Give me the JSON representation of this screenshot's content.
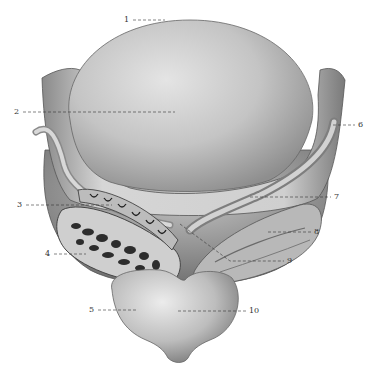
{
  "figure": {
    "background": "#ffffff",
    "ink_color": "#333333",
    "labels": [
      {
        "id": "1",
        "text": "1",
        "tx": 124,
        "ty": 16,
        "x1": 133,
        "y1": 20,
        "x2": 165,
        "y2": 20
      },
      {
        "id": "2",
        "text": "2",
        "tx": 14,
        "ty": 108,
        "x1": 23,
        "y1": 112,
        "x2": 175,
        "y2": 112
      },
      {
        "id": "3",
        "text": "3",
        "tx": 17,
        "ty": 201,
        "x1": 26,
        "y1": 205,
        "x2": 112,
        "y2": 205
      },
      {
        "id": "4",
        "text": "4",
        "tx": 45,
        "ty": 250,
        "x1": 54,
        "y1": 254,
        "x2": 86,
        "y2": 254
      },
      {
        "id": "5",
        "text": "5",
        "tx": 89,
        "ty": 306,
        "x1": 98,
        "y1": 310,
        "x2": 137,
        "y2": 310
      },
      {
        "id": "6",
        "text": "6",
        "tx": 358,
        "ty": 121,
        "x1": 333,
        "y1": 125,
        "x2": 355,
        "y2": 125
      },
      {
        "id": "7",
        "text": "7",
        "tx": 334,
        "ty": 193,
        "x1": 250,
        "y1": 197,
        "x2": 331,
        "y2": 197
      },
      {
        "id": "8",
        "text": "8",
        "tx": 314,
        "ty": 228,
        "x1": 268,
        "y1": 232,
        "x2": 311,
        "y2": 232
      },
      {
        "id": "9",
        "text": "9",
        "tx": 287,
        "ty": 257,
        "x1": 180,
        "y1": 224,
        "x2": 284,
        "y2": 261
      },
      {
        "id": "10",
        "text": "10",
        "tx": 249,
        "ty": 307,
        "x1": 178,
        "y1": 311,
        "x2": 246,
        "y2": 311
      }
    ]
  }
}
